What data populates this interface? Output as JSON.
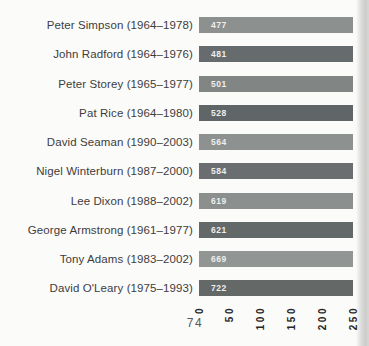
{
  "page": {
    "number": "74",
    "background": "#fbfbfa",
    "edge_shadow_color": "#cdcdcc"
  },
  "chart_data": {
    "type": "bar",
    "orientation": "horizontal",
    "title": "",
    "xlabel": "",
    "ylabel": "",
    "categories": [
      "Peter Simpson (1964–1978)",
      "John Radford (1964–1976)",
      "Peter Storey (1965–1977)",
      "Pat Rice (1964–1980)",
      "David Seaman (1990–2003)",
      "Nigel Winterburn (1987–2000)",
      "Lee Dixon (1988–2002)",
      "George Armstrong (1961–1977)",
      "Tony Adams (1983–2002)",
      "David O'Leary (1975–1993)"
    ],
    "values": [
      477,
      481,
      501,
      528,
      564,
      584,
      619,
      621,
      669,
      722
    ],
    "players": [
      {
        "label": "Peter Simpson (1964–1978)",
        "value": "477",
        "color": "#8c908e"
      },
      {
        "label": "John Radford (1964–1976)",
        "value": "481",
        "color": "#666b6d"
      },
      {
        "label": "Peter Storey (1965–1977)",
        "value": "501",
        "color": "#818584"
      },
      {
        "label": "Pat Rice (1964–1980)",
        "value": "528",
        "color": "#606567"
      },
      {
        "label": "David Seaman (1990–2003)",
        "value": "564",
        "color": "#8d918f"
      },
      {
        "label": "Nigel Winterburn (1987–2000)",
        "value": "584",
        "color": "#6a6e70"
      },
      {
        "label": "Lee Dixon (1988–2002)",
        "value": "619",
        "color": "#8b8f8d"
      },
      {
        "label": "George Armstrong (1961–1977)",
        "value": "621",
        "color": "#636869"
      },
      {
        "label": "Tony Adams (1983–2002)",
        "value": "669",
        "color": "#919593"
      },
      {
        "label": "David O'Leary (1975–1993)",
        "value": "722",
        "color": "#646968"
      }
    ],
    "xlim": [
      0,
      250
    ],
    "xticks": [
      "0",
      "50",
      "100",
      "150",
      "200",
      "250"
    ],
    "xtick_rotation": -90,
    "grid": false,
    "legend": false,
    "bar_value_labels_inside": true,
    "bars_clipped_at_xmax": true,
    "label_color": "#3d3d3d",
    "tick_color": "#262626",
    "value_label_color": "#eeeeee"
  }
}
